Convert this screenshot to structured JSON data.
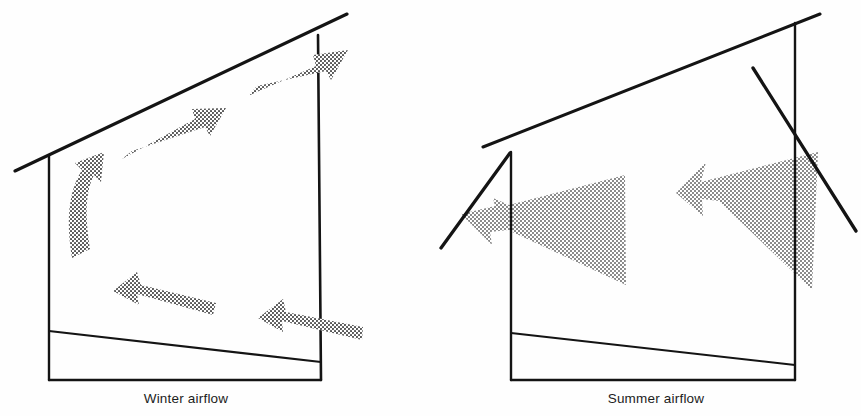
{
  "figure": {
    "background_color": "#fefefe",
    "line_color": "#141414",
    "arrow_fill_color": "#8c8c8c",
    "arrow_texture": "halftone-dot-screen"
  },
  "panels": [
    {
      "id": "winter",
      "caption": "Winter airflow",
      "building": {
        "name": "sloped-roof-building",
        "roof_line": "rises left-to-right",
        "windows_open": false
      },
      "arrows": [
        {
          "name": "arrow-rising-up-left-wall",
          "direction": "up",
          "style": "curved",
          "label": ""
        },
        {
          "name": "arrow-along-ceiling-lower",
          "direction": "up-right",
          "style": "tapered",
          "label": ""
        },
        {
          "name": "arrow-exiting-upper-right",
          "direction": "up-right",
          "style": "tapered",
          "label": ""
        },
        {
          "name": "arrow-return-floor-left",
          "direction": "left",
          "style": "tapered",
          "label": ""
        },
        {
          "name": "arrow-entering-lower-right",
          "direction": "left",
          "style": "tapered",
          "label": ""
        }
      ]
    },
    {
      "id": "summer",
      "caption": "Summer airflow",
      "building": {
        "name": "sloped-roof-building",
        "roof_line": "rises left-to-right",
        "windows_open": true,
        "window_left": "awning-window-open-outward",
        "window_right": "awning-window-open-outward"
      },
      "arrows": [
        {
          "name": "arrow-cross-ventilation-inflow",
          "direction": "left",
          "style": "tapered-large",
          "label": ""
        },
        {
          "name": "arrow-cross-ventilation-outflow",
          "direction": "left",
          "style": "tapered-large",
          "label": ""
        }
      ]
    }
  ],
  "captions": {
    "winter": "Winter airflow",
    "summer": "Summer airflow"
  }
}
